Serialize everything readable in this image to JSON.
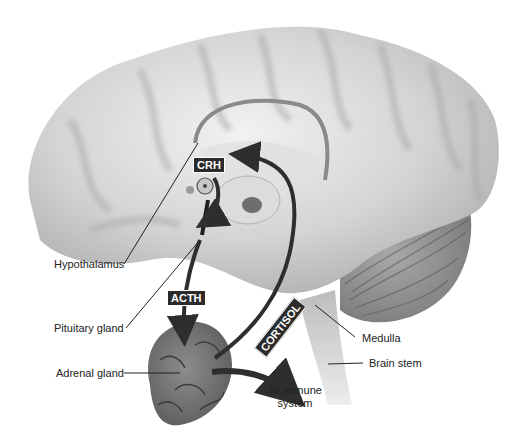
{
  "diagram": {
    "colors": {
      "brain_light": "#e6e6e6",
      "brain_mid": "#bdbdbd",
      "brain_dark": "#8a8a8a",
      "arrow": "#2e2e2e",
      "tag_bg": "#2b2b2b",
      "tag_text": "#ffffff",
      "label_text": "#222222"
    },
    "hormone_tags": {
      "crh": "CRH",
      "acth": "ACTH",
      "cortisol": "CORTISOL"
    },
    "labels": {
      "hypothalamus": "Hypothalamus",
      "pituitary_gland": "Pituitary gland",
      "adrenal_gland": "Adrenal gland",
      "medulla": "Medulla",
      "brain_stem": "Brain stem",
      "to_immune_line1": "To immune",
      "to_immune_line2": "system"
    }
  }
}
